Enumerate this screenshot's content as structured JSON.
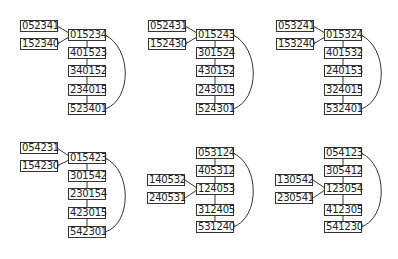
{
  "panels": [
    {
      "id": "top-left",
      "chain": [
        "015234",
        "401523",
        "340152",
        "234015",
        "523401"
      ],
      "attach_index": 0,
      "side": [
        "052341",
        "152340"
      ]
    },
    {
      "id": "top-middle",
      "chain": [
        "015243",
        "301524",
        "430152",
        "243015",
        "524301"
      ],
      "attach_index": 0,
      "side": [
        "052431",
        "152430"
      ]
    },
    {
      "id": "top-right",
      "chain": [
        "015324",
        "401532",
        "240153",
        "324015",
        "532401"
      ],
      "attach_index": 0,
      "side": [
        "053241",
        "153240"
      ]
    },
    {
      "id": "bottom-left",
      "chain": [
        "015423",
        "301542",
        "230154",
        "423015",
        "542301"
      ],
      "attach_index": 0,
      "side": [
        "054231",
        "154230"
      ]
    },
    {
      "id": "bottom-middle",
      "chain": [
        "053124",
        "405312",
        "124053",
        "312405",
        "531240"
      ],
      "attach_index": 2,
      "side": [
        "140532",
        "240531"
      ]
    },
    {
      "id": "bottom-right",
      "chain": [
        "054123",
        "305412",
        "123054",
        "412305",
        "541230"
      ],
      "attach_index": 2,
      "side": [
        "130542",
        "230541"
      ]
    }
  ],
  "colors": {
    "stroke": "#333333",
    "text": "#222222",
    "background": "#ffffff"
  }
}
